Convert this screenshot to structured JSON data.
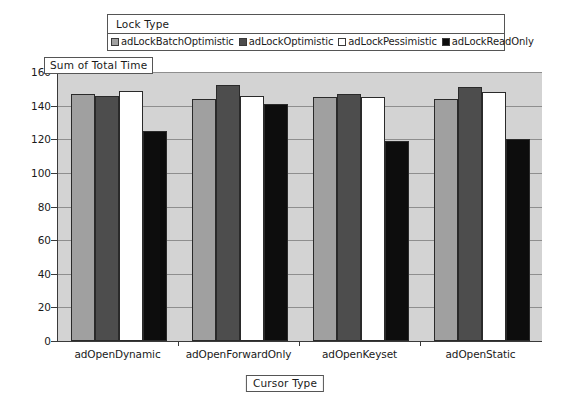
{
  "legend": {
    "title": "Lock Type",
    "entries": [
      {
        "label": "adLockBatchOptimistic",
        "color": "#a0a0a0"
      },
      {
        "label": "adLockOptimistic",
        "color": "#4d4d4d"
      },
      {
        "label": "adLockPessimistic",
        "color": "#ffffff"
      },
      {
        "label": "adLockReadOnly",
        "color": "#0d0d0d"
      }
    ]
  },
  "chart_data": {
    "type": "bar",
    "title": "",
    "xlabel": "Cursor Type",
    "ylabel": "Sum of Total Time",
    "ylim": [
      0,
      160
    ],
    "yticks": [
      0,
      20,
      40,
      60,
      80,
      100,
      120,
      140,
      160
    ],
    "grid": true,
    "legend_position": "top",
    "categories": [
      "adOpenDynamic",
      "adOpenForwardOnly",
      "adOpenKeyset",
      "adOpenStatic"
    ],
    "series": [
      {
        "name": "adLockBatchOptimistic",
        "color": "#a0a0a0",
        "values": [
          147,
          144,
          145,
          144
        ]
      },
      {
        "name": "adLockOptimistic",
        "color": "#4d4d4d",
        "values": [
          146,
          152,
          147,
          151
        ]
      },
      {
        "name": "adLockPessimistic",
        "color": "#ffffff",
        "values": [
          149,
          146,
          145,
          148
        ]
      },
      {
        "name": "adLockReadOnly",
        "color": "#0d0d0d",
        "values": [
          125,
          141,
          119,
          120
        ]
      }
    ]
  }
}
